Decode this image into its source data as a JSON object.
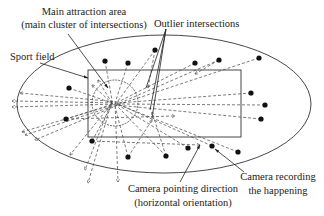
{
  "diagram": {
    "labels": {
      "main_attraction_line1": "Main attraction area",
      "main_attraction_line2": "(main cluster of intersections)",
      "outlier": "Outlier intersections",
      "sport_field": "Sport field",
      "camera_direction_line1": "Camera pointing direction",
      "camera_direction_line2": "(horizontal orientation)",
      "camera_recording_line1": "Camera recording",
      "camera_recording_line2": "the happening"
    },
    "colors": {
      "stroke": "#333333",
      "camera": "#111111",
      "background": "#ffffff"
    },
    "shapes": {
      "stadium_ellipse": {
        "cx": 164,
        "cy": 104,
        "rx": 147,
        "ry": 69
      },
      "sport_field_rect": {
        "x": 88,
        "y": 70,
        "width": 153,
        "height": 67
      },
      "attraction_circle": {
        "cx": 115,
        "cy": 103,
        "r": 23
      }
    },
    "cameras": [
      {
        "x": 155,
        "y": 50
      },
      {
        "x": 105,
        "y": 61
      },
      {
        "x": 128,
        "y": 63
      },
      {
        "x": 195,
        "y": 63
      },
      {
        "x": 219,
        "y": 60
      },
      {
        "x": 259,
        "y": 58
      },
      {
        "x": 69,
        "y": 88
      },
      {
        "x": 251,
        "y": 93
      },
      {
        "x": 265,
        "y": 105
      },
      {
        "x": 261,
        "y": 119
      },
      {
        "x": 66,
        "y": 119
      },
      {
        "x": 92,
        "y": 141
      },
      {
        "x": 128,
        "y": 157
      },
      {
        "x": 166,
        "y": 156
      },
      {
        "x": 188,
        "y": 148
      },
      {
        "x": 212,
        "y": 146
      },
      {
        "x": 238,
        "y": 152
      }
    ]
  }
}
